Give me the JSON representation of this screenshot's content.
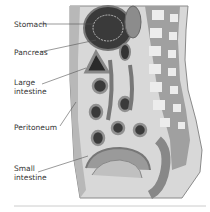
{
  "diagram": {
    "type": "anatomical-cross-section",
    "labels": [
      {
        "id": "stomach",
        "text": "Stomach"
      },
      {
        "id": "pancreas",
        "text": "Pancreas"
      },
      {
        "id": "large-intestine-1",
        "text": "Large"
      },
      {
        "id": "large-intestine-2",
        "text": "intestine"
      },
      {
        "id": "peritoneum",
        "text": "Peritoneum"
      },
      {
        "id": "small-intestine-1",
        "text": "Small"
      },
      {
        "id": "small-intestine-2",
        "text": "intestine"
      }
    ],
    "colors": {
      "outline": "#7a7a7a",
      "body_fill": "#d8d8d8",
      "spine": "#a0a0a0",
      "vertebra": "#ececec",
      "organ_dark": "#3a3a3a",
      "organ_mid": "#8c8c8c",
      "leader_line": "#555555",
      "divider": "#cccccc"
    }
  }
}
